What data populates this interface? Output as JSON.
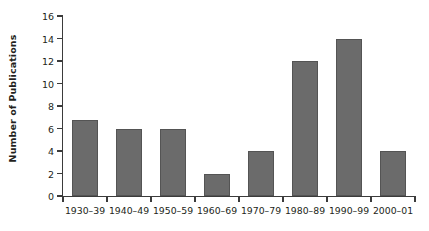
{
  "chart_data": {
    "type": "bar",
    "title": "",
    "subtitle": "",
    "xlabel": "",
    "ylabel": "Number of Publications",
    "categories": [
      "1930–39",
      "1940–49",
      "1950–59",
      "1960–69",
      "1970–79",
      "1980–89",
      "1990–99",
      "2000–01"
    ],
    "values": [
      6.8,
      6,
      6,
      2,
      4,
      12,
      14,
      4
    ],
    "ylim": [
      0,
      16
    ],
    "xlim_categories": 8,
    "y_ticks": [
      0,
      2,
      4,
      6,
      8,
      10,
      12,
      14,
      16
    ],
    "y_tick_labels": [
      "0",
      "2",
      "4",
      "6",
      "8",
      "10",
      "12",
      "14",
      "16"
    ],
    "grid": false,
    "legend": null,
    "legend_position": "none",
    "bar_color": "#6b6b6b",
    "bar_edge_color": "#545454",
    "axis_color": "#3b3b3b",
    "text_color": "#231f20",
    "background_color": "#ffffff",
    "x_tick_style": "category-boundaries",
    "bar_width_fraction": 0.6
  }
}
